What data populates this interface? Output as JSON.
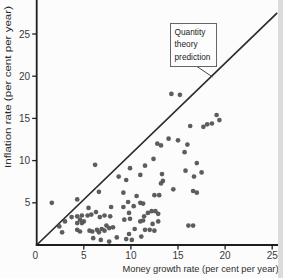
{
  "page": {
    "background": "#fcfcfc",
    "page_edge_color": "#dcdcdc"
  },
  "chart_data": {
    "type": "scatter",
    "title": "",
    "xlabel": "Money growth rate (per cent per year)",
    "ylabel": "Inflation rate (per cent per year)",
    "xlim": [
      0,
      25
    ],
    "ylim": [
      0,
      25
    ],
    "xticks": [
      0,
      5,
      10,
      15,
      20,
      25
    ],
    "yticks": [
      5,
      10,
      15,
      20,
      25
    ],
    "grid": false,
    "legend": "none",
    "reference_line": {
      "label": "Quantity theory prediction",
      "slope": 1,
      "intercept": 0
    },
    "annotation": {
      "label_lines": [
        "Quantity",
        "theory",
        "prediction"
      ]
    },
    "styles": {
      "point_color": "#545454",
      "line_color": "#2b2b2b",
      "axis_color": "#1e1e1e",
      "annotation_border": "#666666",
      "leader_color": "#444444"
    },
    "points": [
      [
        1.6,
        5.0
      ],
      [
        2.4,
        2.2
      ],
      [
        2.7,
        1.5
      ],
      [
        3.0,
        2.8
      ],
      [
        3.7,
        3.3
      ],
      [
        4.3,
        3.4
      ],
      [
        4.8,
        3.5
      ],
      [
        4.6,
        3.0
      ],
      [
        4.3,
        2.6
      ],
      [
        4.8,
        2.6
      ],
      [
        5.0,
        2.8
      ],
      [
        4.3,
        1.8
      ],
      [
        4.6,
        1.6
      ],
      [
        4.3,
        5.4
      ],
      [
        5.5,
        4.4
      ],
      [
        5.4,
        3.5
      ],
      [
        5.8,
        3.6
      ],
      [
        6.3,
        3.9
      ],
      [
        6.7,
        3.3
      ],
      [
        7.2,
        3.5
      ],
      [
        7.8,
        3.4
      ],
      [
        5.6,
        1.7
      ],
      [
        5.9,
        1.6
      ],
      [
        6.4,
        1.8
      ],
      [
        6.6,
        1.5
      ],
      [
        6.9,
        1.9
      ],
      [
        7.2,
        1.7
      ],
      [
        6.0,
        0.8
      ],
      [
        6.8,
        0.6
      ],
      [
        7.7,
        0.4
      ],
      [
        8.5,
        0.9
      ],
      [
        9.5,
        0.7
      ],
      [
        10.1,
        0.6
      ],
      [
        7.4,
        2.3
      ],
      [
        7.7,
        2.0
      ],
      [
        8.1,
        2.1
      ],
      [
        9.8,
        1.3
      ],
      [
        10.4,
        1.9
      ],
      [
        11.5,
        1.8
      ],
      [
        12.0,
        1.8
      ],
      [
        11.1,
        1.0
      ],
      [
        12.5,
        1.7
      ],
      [
        6.2,
        9.5
      ],
      [
        6.6,
        6.3
      ],
      [
        8.7,
        8.1
      ],
      [
        9.5,
        7.7
      ],
      [
        9.9,
        9.1
      ],
      [
        11.0,
        8.3
      ],
      [
        11.5,
        9.4
      ],
      [
        12.4,
        10.2
      ],
      [
        9.2,
        6.2
      ],
      [
        10.6,
        5.8
      ],
      [
        12.5,
        5.9
      ],
      [
        13.0,
        5.9
      ],
      [
        14.5,
        6.6
      ],
      [
        9.7,
        5.1
      ],
      [
        11.0,
        5.0
      ],
      [
        11.3,
        4.9
      ],
      [
        10.3,
        4.6
      ],
      [
        9.2,
        4.5
      ],
      [
        7.9,
        4.5
      ],
      [
        9.8,
        3.8
      ],
      [
        9.3,
        3.0
      ],
      [
        9.9,
        3.1
      ],
      [
        11.8,
        3.8
      ],
      [
        12.2,
        4.0
      ],
      [
        12.6,
        4.0
      ],
      [
        12.9,
        3.7
      ],
      [
        11.4,
        3.4
      ],
      [
        11.0,
        2.8
      ],
      [
        11.3,
        2.9
      ],
      [
        12.9,
        2.8
      ],
      [
        12.3,
        2.5
      ],
      [
        13.3,
        8.4
      ],
      [
        13.4,
        7.6
      ],
      [
        13.2,
        7.3
      ],
      [
        15.8,
        8.8
      ],
      [
        17.0,
        9.7
      ],
      [
        17.5,
        8.6
      ],
      [
        16.7,
        8.1
      ],
      [
        16.6,
        6.4
      ],
      [
        17.0,
        6.2
      ],
      [
        16.1,
        2.3
      ],
      [
        16.6,
        2.3
      ],
      [
        12.8,
        12.0
      ],
      [
        13.2,
        11.8
      ],
      [
        14.0,
        12.6
      ],
      [
        15.0,
        12.4
      ],
      [
        16.0,
        11.9
      ],
      [
        15.7,
        11.0
      ],
      [
        16.3,
        14.1
      ],
      [
        17.7,
        14.0
      ],
      [
        18.1,
        14.3
      ],
      [
        18.6,
        14.4
      ],
      [
        19.1,
        15.4
      ],
      [
        19.4,
        14.8
      ],
      [
        14.3,
        17.9
      ],
      [
        15.2,
        17.8
      ]
    ]
  }
}
